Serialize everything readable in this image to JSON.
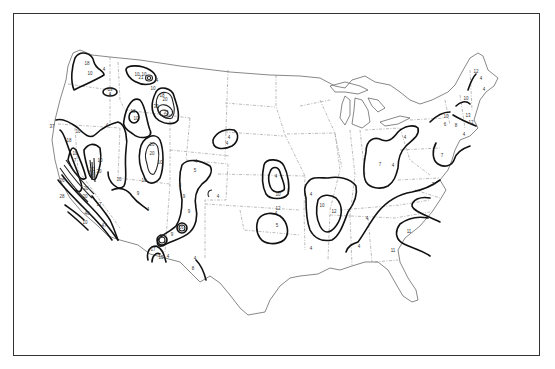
{
  "map": {
    "type": "contour-isopleth",
    "region": "Contiguous United States",
    "frame": {
      "left": 13,
      "top": 13,
      "right": 541,
      "bottom": 357
    },
    "colors": {
      "contour": "#111111",
      "outline": "#555555",
      "state_boundary": "#777777",
      "background": "#ffffff"
    },
    "labels": [
      {
        "id": "wa-18",
        "text": "18",
        "x": 87,
        "y": 65
      },
      {
        "id": "wa-10",
        "text": "10",
        "x": 90,
        "y": 75
      },
      {
        "id": "wa-4",
        "text": "4",
        "x": 104,
        "y": 71
      },
      {
        "id": "mt-10a",
        "text": "10",
        "x": 137,
        "y": 76
      },
      {
        "id": "mt-21",
        "text": "21",
        "x": 141,
        "y": 79
      },
      {
        "id": "mt-10b",
        "text": "10",
        "x": 144,
        "y": 76
      },
      {
        "id": "mt-4",
        "text": "4",
        "x": 157,
        "y": 82
      },
      {
        "id": "mt-10c",
        "text": "10",
        "x": 153,
        "y": 90
      },
      {
        "id": "mt-18",
        "text": "18",
        "x": 162,
        "y": 97
      },
      {
        "id": "mt-20",
        "text": "20",
        "x": 165,
        "y": 101
      },
      {
        "id": "mt-30",
        "text": "30",
        "x": 156,
        "y": 108
      },
      {
        "id": "mt-35",
        "text": "35",
        "x": 166,
        "y": 114
      },
      {
        "id": "id-19",
        "text": "19",
        "x": 110,
        "y": 91
      },
      {
        "id": "id-4",
        "text": "4",
        "x": 110,
        "y": 96
      },
      {
        "id": "id-18",
        "text": "18",
        "x": 133,
        "y": 113
      },
      {
        "id": "id-10",
        "text": "10",
        "x": 136,
        "y": 120
      },
      {
        "id": "or-37",
        "text": "37",
        "x": 52,
        "y": 128
      },
      {
        "id": "or-10",
        "text": "10",
        "x": 78,
        "y": 133
      },
      {
        "id": "or-4",
        "text": "4",
        "x": 107,
        "y": 127
      },
      {
        "id": "or-18",
        "text": "18",
        "x": 69,
        "y": 142
      },
      {
        "id": "nv-10",
        "text": "10",
        "x": 75,
        "y": 155
      },
      {
        "id": "nv-7",
        "text": "7",
        "x": 75,
        "y": 162
      },
      {
        "id": "ut-10",
        "text": "10",
        "x": 100,
        "y": 162
      },
      {
        "id": "ut-20a",
        "text": "20",
        "x": 92,
        "y": 171
      },
      {
        "id": "ut-30",
        "text": "30",
        "x": 91,
        "y": 175
      },
      {
        "id": "ut-20b",
        "text": "20",
        "x": 99,
        "y": 173
      },
      {
        "id": "ut-20c",
        "text": "20",
        "x": 86,
        "y": 190
      },
      {
        "id": "ut-10b",
        "text": "10",
        "x": 119,
        "y": 181
      },
      {
        "id": "wy-20",
        "text": "20",
        "x": 152,
        "y": 146
      },
      {
        "id": "wy-10",
        "text": "10",
        "x": 144,
        "y": 182
      },
      {
        "id": "co-20",
        "text": "20",
        "x": 152,
        "y": 155
      },
      {
        "id": "co-10",
        "text": "10",
        "x": 160,
        "y": 164
      },
      {
        "id": "ca-26",
        "text": "26",
        "x": 62,
        "y": 182
      },
      {
        "id": "ca-28",
        "text": "28",
        "x": 62,
        "y": 198
      },
      {
        "id": "ca-20",
        "text": "20",
        "x": 85,
        "y": 198
      },
      {
        "id": "ca-17",
        "text": "17",
        "x": 99,
        "y": 206
      },
      {
        "id": "ca-40",
        "text": "40",
        "x": 87,
        "y": 215
      },
      {
        "id": "ca-10",
        "text": "10",
        "x": 85,
        "y": 224
      },
      {
        "id": "ca-47",
        "text": "47",
        "x": 104,
        "y": 227
      },
      {
        "id": "az-9",
        "text": "9",
        "x": 138,
        "y": 195
      },
      {
        "id": "az-4",
        "text": "4",
        "x": 148,
        "y": 211
      },
      {
        "id": "nm-4a",
        "text": "4",
        "x": 196,
        "y": 163
      },
      {
        "id": "nm-5",
        "text": "5",
        "x": 195,
        "y": 172
      },
      {
        "id": "nm-8",
        "text": "8",
        "x": 180,
        "y": 187
      },
      {
        "id": "nm-9a",
        "text": "9",
        "x": 184,
        "y": 198
      },
      {
        "id": "nm-4b",
        "text": "4",
        "x": 218,
        "y": 198
      },
      {
        "id": "nm-9b",
        "text": "9",
        "x": 189,
        "y": 213
      },
      {
        "id": "nm-16",
        "text": "16",
        "x": 181,
        "y": 229
      },
      {
        "id": "nm-9c",
        "text": "9",
        "x": 172,
        "y": 236
      },
      {
        "id": "nm-15",
        "text": "15",
        "x": 162,
        "y": 238
      },
      {
        "id": "nm-17",
        "text": "17",
        "x": 153,
        "y": 251
      },
      {
        "id": "nm-15b",
        "text": "15",
        "x": 161,
        "y": 259
      },
      {
        "id": "nm-4c",
        "text": "4",
        "x": 168,
        "y": 258
      },
      {
        "id": "tx-4",
        "text": "4",
        "x": 195,
        "y": 260
      },
      {
        "id": "tx-8",
        "text": "8",
        "x": 193,
        "y": 270
      },
      {
        "id": "sd-4a",
        "text": "4",
        "x": 229,
        "y": 139
      },
      {
        "id": "sd-4b",
        "text": "4",
        "x": 227,
        "y": 145
      },
      {
        "id": "ne-4",
        "text": "4",
        "x": 276,
        "y": 178
      },
      {
        "id": "ne-10",
        "text": "10",
        "x": 278,
        "y": 196
      },
      {
        "id": "ne-12",
        "text": "12",
        "x": 278,
        "y": 210
      },
      {
        "id": "ks-4",
        "text": "4",
        "x": 276,
        "y": 215
      },
      {
        "id": "ks-5",
        "text": "5",
        "x": 277,
        "y": 227
      },
      {
        "id": "mo-4",
        "text": "4",
        "x": 311,
        "y": 196
      },
      {
        "id": "mo-10",
        "text": "10",
        "x": 322,
        "y": 207
      },
      {
        "id": "mo-12",
        "text": "12",
        "x": 334,
        "y": 213
      },
      {
        "id": "ms-4",
        "text": "4",
        "x": 311,
        "y": 250
      },
      {
        "id": "oh-4",
        "text": "4",
        "x": 405,
        "y": 139
      },
      {
        "id": "oh-7",
        "text": "7",
        "x": 380,
        "y": 166
      },
      {
        "id": "oh-4b",
        "text": "4",
        "x": 393,
        "y": 167
      },
      {
        "id": "tn-4",
        "text": "4",
        "x": 367,
        "y": 220
      },
      {
        "id": "ga-4",
        "text": "4",
        "x": 359,
        "y": 248
      },
      {
        "id": "nc-7",
        "text": "7",
        "x": 433,
        "y": 186
      },
      {
        "id": "sc-11",
        "text": "11",
        "x": 409,
        "y": 233
      },
      {
        "id": "sc-11b",
        "text": "11",
        "x": 393,
        "y": 252
      },
      {
        "id": "ny-10",
        "text": "10",
        "x": 446,
        "y": 118
      },
      {
        "id": "ny-6",
        "text": "6",
        "x": 445,
        "y": 126
      },
      {
        "id": "ny-8",
        "text": "8",
        "x": 456,
        "y": 127
      },
      {
        "id": "pa-4",
        "text": "4",
        "x": 464,
        "y": 136
      },
      {
        "id": "pa-7",
        "text": "7",
        "x": 442,
        "y": 157
      },
      {
        "id": "ne-13",
        "text": "13",
        "x": 468,
        "y": 117
      },
      {
        "id": "ne-12b",
        "text": "12",
        "x": 471,
        "y": 124
      },
      {
        "id": "vt-10",
        "text": "10",
        "x": 466,
        "y": 100
      },
      {
        "id": "me-12",
        "text": "12",
        "x": 476,
        "y": 73
      },
      {
        "id": "me-4",
        "text": "4",
        "x": 484,
        "y": 91
      },
      {
        "id": "me-4b",
        "text": "4",
        "x": 481,
        "y": 80
      }
    ]
  }
}
